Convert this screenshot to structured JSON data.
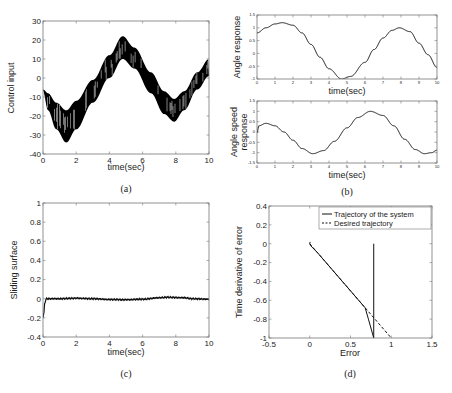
{
  "figure": {
    "captions": [
      "(a)",
      "(b)",
      "(c)",
      "(d)"
    ]
  },
  "chart_data": [
    {
      "id": "a",
      "type": "line",
      "caption": "(a)",
      "title": "",
      "xlabel": "time(sec)",
      "ylabel": "Control input",
      "xlim": [
        0,
        10
      ],
      "ylim": [
        -40,
        30
      ],
      "xticks": [
        0,
        2,
        4,
        6,
        8,
        10
      ],
      "yticks": [
        -40,
        -30,
        -20,
        -10,
        0,
        10,
        20,
        30
      ],
      "grid": false,
      "note": "High-frequency chattering band between upper and lower envelopes",
      "series": [
        {
          "name": "upper envelope",
          "x": [
            0,
            0.3,
            0.8,
            1.4,
            2,
            3,
            4,
            4.8,
            5.5,
            6.5,
            7.3,
            7.9,
            8.5,
            9.3,
            10
          ],
          "values": [
            -6,
            -8,
            -13,
            -17,
            -12,
            -1,
            12,
            22,
            16,
            3,
            -7,
            -11,
            -7,
            3,
            10
          ]
        },
        {
          "name": "lower envelope",
          "x": [
            0,
            0.3,
            0.8,
            1.4,
            2,
            3,
            4,
            4.8,
            5.5,
            6.5,
            7.3,
            7.9,
            8.5,
            9.3,
            10
          ],
          "values": [
            -7,
            -17,
            -27,
            -34,
            -27,
            -13,
            0,
            10,
            5,
            -8,
            -19,
            -23,
            -17,
            -6,
            1
          ]
        }
      ]
    },
    {
      "id": "b-top",
      "type": "line",
      "caption": "(b)",
      "xlabel": "time(sec)",
      "ylabel": "Angle response",
      "xlim": [
        0,
        10
      ],
      "ylim": [
        -1,
        1.5
      ],
      "xticks": [
        0,
        1,
        2,
        3,
        4,
        5,
        6,
        7,
        8,
        9,
        10
      ],
      "yticks": [
        -1,
        -0.5,
        0,
        0.5,
        1,
        1.5
      ],
      "grid": false,
      "series": [
        {
          "name": "angle",
          "x": [
            0,
            0.5,
            1,
            1.4,
            2,
            2.5,
            3,
            3.5,
            4,
            4.7,
            5.2,
            6,
            6.5,
            7,
            7.5,
            7.9,
            8.5,
            9,
            9.5,
            10
          ],
          "values": [
            0.8,
            1.0,
            1.15,
            1.2,
            1.1,
            0.8,
            0.35,
            -0.15,
            -0.6,
            -1.0,
            -0.9,
            -0.35,
            0.15,
            0.6,
            0.9,
            1.0,
            0.85,
            0.4,
            -0.05,
            -0.55
          ]
        }
      ]
    },
    {
      "id": "b-bottom",
      "type": "line",
      "caption": "(b)",
      "xlabel": "time(sec)",
      "ylabel": "Angle speed response",
      "xlim": [
        0,
        10
      ],
      "ylim": [
        -1.5,
        1.5
      ],
      "xticks": [
        0,
        1,
        2,
        3,
        4,
        5,
        6,
        7,
        8,
        9,
        10
      ],
      "yticks": [
        -1.5,
        -1,
        -0.5,
        0,
        0.5,
        1,
        1.5
      ],
      "grid": false,
      "series": [
        {
          "name": "angle speed",
          "x": [
            0,
            0.1,
            0.5,
            1,
            1.5,
            2,
            2.5,
            3.1,
            3.7,
            4.3,
            5,
            5.6,
            6.3,
            7,
            7.6,
            8.2,
            8.8,
            9.3,
            9.7,
            10
          ],
          "values": [
            -0.05,
            0.3,
            0.42,
            0.3,
            0.0,
            -0.4,
            -0.8,
            -1.05,
            -0.9,
            -0.45,
            0.2,
            0.7,
            1.0,
            0.8,
            0.3,
            -0.35,
            -0.85,
            -1.05,
            -1.0,
            -0.88
          ]
        }
      ]
    },
    {
      "id": "c",
      "type": "line",
      "caption": "(c)",
      "xlabel": "time(sec)",
      "ylabel": "Sliding surface",
      "xlim": [
        0,
        10
      ],
      "ylim": [
        -0.4,
        1
      ],
      "xticks": [
        0,
        2,
        4,
        6,
        8,
        10
      ],
      "yticks": [
        -0.4,
        -0.2,
        0,
        0.2,
        0.4,
        0.6,
        0.8,
        1
      ],
      "grid": false,
      "series": [
        {
          "name": "sliding surface",
          "x": [
            0,
            0.05,
            0.1,
            0.2,
            1,
            2,
            3,
            4,
            5,
            6,
            7,
            7.5,
            8,
            8.5,
            9,
            10
          ],
          "values": [
            -0.2,
            -0.15,
            -0.05,
            0.0,
            0.0,
            0.005,
            0.0,
            -0.008,
            -0.01,
            -0.005,
            0.01,
            0.015,
            0.012,
            0.01,
            0.0,
            -0.005
          ]
        }
      ]
    },
    {
      "id": "d",
      "type": "line",
      "caption": "(d)",
      "xlabel": "Error",
      "ylabel": "Time derivative of error",
      "xlim": [
        -0.5,
        1.5
      ],
      "ylim": [
        -1,
        0.4
      ],
      "xticks": [
        -0.5,
        0,
        0.5,
        1,
        1.5
      ],
      "yticks": [
        -1,
        -0.8,
        -0.6,
        -0.4,
        -0.2,
        0,
        0.2,
        0.4
      ],
      "grid": false,
      "legend": {
        "position": "upper right",
        "entries": [
          "Trajectory of the system",
          "Desired trajectory"
        ]
      },
      "series": [
        {
          "name": "Trajectory of the system",
          "style": "solid",
          "x": [
            0.785,
            0.785,
            0.72,
            0.68,
            0.4,
            0.1,
            0.01,
            0.0,
            0.005
          ],
          "values": [
            0.0,
            -1.0,
            -0.8,
            -0.68,
            -0.4,
            -0.1,
            -0.02,
            0.0,
            0.02
          ]
        },
        {
          "name": "Desired trajectory",
          "style": "dashed",
          "x": [
            0.0,
            1.0
          ],
          "values": [
            0.0,
            -1.0
          ]
        }
      ]
    }
  ]
}
